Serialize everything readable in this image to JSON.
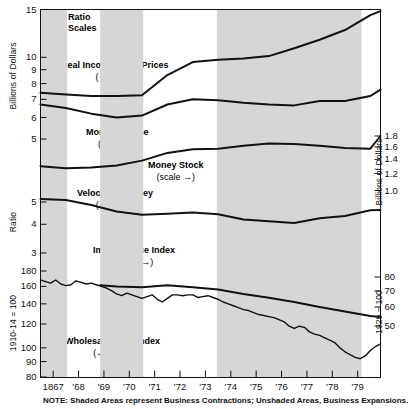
{
  "chart_data": {
    "type": "line",
    "title": "",
    "subtitle": "",
    "note": "NOTE: Shaded Areas represent Business Contractions; Unshaded Areas, Business Expansions.",
    "scale_note": "Ratio\nScales",
    "scale_note_line1": "Ratio",
    "scale_note_line2": "Scales",
    "grid": false,
    "legend_position": "inline-annotations",
    "x": {
      "label": "",
      "tick_labels": [
        "1867",
        "'68",
        "'69",
        "'70",
        "'71",
        "'72",
        "'73",
        "'74",
        "'75",
        "'76",
        "'77",
        "'78",
        "'79"
      ],
      "range": [
        1866.5,
        1879.9
      ]
    },
    "left_axes": [
      {
        "name": "billions-of-dollars-left",
        "label": "Billions of Dollars",
        "tick_labels": [
          "15",
          "10",
          "9",
          "8",
          "7",
          "6",
          "5"
        ],
        "tick_values": [
          15,
          10,
          9,
          8,
          7,
          6,
          5
        ],
        "scale": "log"
      },
      {
        "name": "ratio-left",
        "label": "Ratio",
        "tick_labels": [
          "5",
          "4",
          "3"
        ],
        "tick_values": [
          5,
          4,
          3
        ],
        "scale": "log"
      },
      {
        "name": "index-left",
        "label": "1910-14 = 100",
        "tick_labels": [
          "180",
          "160",
          "140",
          "120",
          "100",
          "90",
          "80"
        ],
        "tick_values": [
          180,
          160,
          140,
          120,
          100,
          90,
          80
        ],
        "scale": "log"
      }
    ],
    "right_axes": [
      {
        "name": "billions-of-dollars-right",
        "label": "Billions of Dollars",
        "tick_labels": [
          "1.8",
          "1.6",
          "1.4",
          "1.2",
          "1.0"
        ],
        "tick_values": [
          1.8,
          1.6,
          1.4,
          1.2,
          1.0
        ],
        "scale": "log"
      },
      {
        "name": "index-right",
        "label": "1929 = 100",
        "tick_labels": [
          "80",
          "70",
          "60",
          "50"
        ],
        "tick_values": [
          80,
          70,
          60,
          50
        ],
        "scale": "log"
      }
    ],
    "shaded_bands": [
      {
        "start": 1866.5,
        "end": 1867.55,
        "kind": "contraction"
      },
      {
        "start": 1868.85,
        "end": 1870.55,
        "kind": "contraction"
      },
      {
        "start": 1873.45,
        "end": 1879.15,
        "kind": "contraction"
      }
    ],
    "series": [
      {
        "name": "Real Income, 1929 Prices",
        "label_line1": "Real Income, 1929 Prices",
        "label_line2": "(← scale)",
        "scale_ref": "left",
        "axis": "billions-of-dollars-left",
        "x": [
          1866.5,
          1867.5,
          1868.5,
          1869.5,
          1870.5,
          1871.5,
          1872.5,
          1873.5,
          1874.5,
          1875.5,
          1876.5,
          1877.5,
          1878.5,
          1879.5,
          1879.9
        ],
        "values": [
          7.4,
          7.3,
          7.2,
          7.2,
          7.25,
          8.6,
          9.6,
          9.8,
          9.9,
          10.1,
          10.8,
          11.6,
          12.6,
          14.3,
          14.8
        ]
      },
      {
        "name": "Money Income",
        "label_line1": "Money Income",
        "label_line2": "(← scale)",
        "scale_ref": "left",
        "axis": "billions-of-dollars-left",
        "x": [
          1866.5,
          1867.5,
          1868.5,
          1869.5,
          1870.5,
          1871.5,
          1872.5,
          1873.5,
          1874.5,
          1875.5,
          1876.5,
          1877.5,
          1878.5,
          1879.5,
          1879.9
        ],
        "values": [
          6.7,
          6.5,
          6.2,
          6.0,
          6.1,
          6.7,
          7.0,
          6.95,
          6.8,
          6.7,
          6.65,
          6.9,
          6.9,
          7.2,
          7.6
        ]
      },
      {
        "name": "Money Stock",
        "label_line1": "Money Stock",
        "label_line2": "(scale →)",
        "scale_ref": "right",
        "axis": "billions-of-dollars-right",
        "x": [
          1866.5,
          1867.5,
          1868.5,
          1869.5,
          1870.5,
          1871.5,
          1872.5,
          1873.5,
          1874.5,
          1875.5,
          1876.5,
          1877.5,
          1878.5,
          1879.5,
          1879.9
        ],
        "values": [
          1.3,
          1.27,
          1.28,
          1.31,
          1.38,
          1.5,
          1.56,
          1.57,
          1.62,
          1.66,
          1.65,
          1.62,
          1.58,
          1.57,
          1.8
        ]
      },
      {
        "name": "Velocity of Money",
        "label_line1": "Velocity of Money",
        "label_line2": "(← scale)",
        "scale_ref": "left",
        "axis": "ratio-left",
        "x": [
          1866.5,
          1867.5,
          1868.5,
          1869.5,
          1870.5,
          1871.5,
          1872.5,
          1873.5,
          1874.5,
          1875.5,
          1876.5,
          1877.5,
          1878.5,
          1879.5,
          1879.9
        ],
        "values": [
          5.15,
          5.1,
          4.85,
          4.55,
          4.4,
          4.45,
          4.5,
          4.42,
          4.2,
          4.12,
          4.05,
          4.25,
          4.35,
          4.6,
          4.62
        ]
      },
      {
        "name": "Implicit Price Index",
        "label_line1": "Implicit Price Index",
        "label_line2": "(scale →)",
        "scale_ref": "right",
        "axis": "index-right",
        "x": [
          1868.85,
          1869.5,
          1870.5,
          1871.5,
          1872.5,
          1873.5,
          1874.5,
          1875.5,
          1876.5,
          1877.5,
          1878.5,
          1879.5,
          1879.9
        ],
        "values": [
          74.0,
          73.0,
          72.5,
          74.0,
          72.5,
          71.0,
          68.0,
          65.5,
          63.0,
          60.0,
          57.5,
          55.0,
          54.5
        ]
      },
      {
        "name": "Wholesale Price Index",
        "label_line1": "Wholesale Price Index",
        "label_line2": "(← scale)",
        "scale_ref": "left",
        "axis": "index-left",
        "x": [
          1866.5,
          1866.7,
          1866.9,
          1867.1,
          1867.3,
          1867.5,
          1867.7,
          1867.9,
          1868.1,
          1868.3,
          1868.5,
          1868.7,
          1868.9,
          1869.1,
          1869.3,
          1869.5,
          1869.7,
          1869.9,
          1870.1,
          1870.3,
          1870.5,
          1870.7,
          1870.9,
          1871.1,
          1871.3,
          1871.5,
          1871.7,
          1871.9,
          1872.1,
          1872.3,
          1872.5,
          1872.7,
          1872.9,
          1873.1,
          1873.3,
          1873.5,
          1873.7,
          1873.9,
          1874.1,
          1874.3,
          1874.5,
          1874.7,
          1874.9,
          1875.1,
          1875.3,
          1875.5,
          1875.7,
          1875.9,
          1876.1,
          1876.3,
          1876.5,
          1876.7,
          1876.9,
          1877.1,
          1877.3,
          1877.5,
          1877.7,
          1877.9,
          1878.1,
          1878.3,
          1878.5,
          1878.7,
          1878.9,
          1879.1,
          1879.3,
          1879.5,
          1879.7,
          1879.9
        ],
        "values": [
          168,
          166,
          164,
          168,
          163,
          161,
          162,
          167,
          165,
          163,
          164,
          162,
          160,
          158,
          155,
          151,
          149,
          152,
          150,
          148,
          146,
          148,
          150,
          145,
          142,
          146,
          150,
          150,
          149,
          150,
          150,
          147,
          148,
          149,
          147,
          145,
          142,
          140,
          138,
          136,
          134,
          133,
          131,
          129,
          128,
          127,
          126,
          124,
          122,
          118,
          116,
          118,
          117,
          113,
          111,
          110,
          108,
          106,
          104,
          100,
          97,
          95,
          93,
          92,
          94,
          98,
          101,
          103
        ]
      }
    ]
  }
}
